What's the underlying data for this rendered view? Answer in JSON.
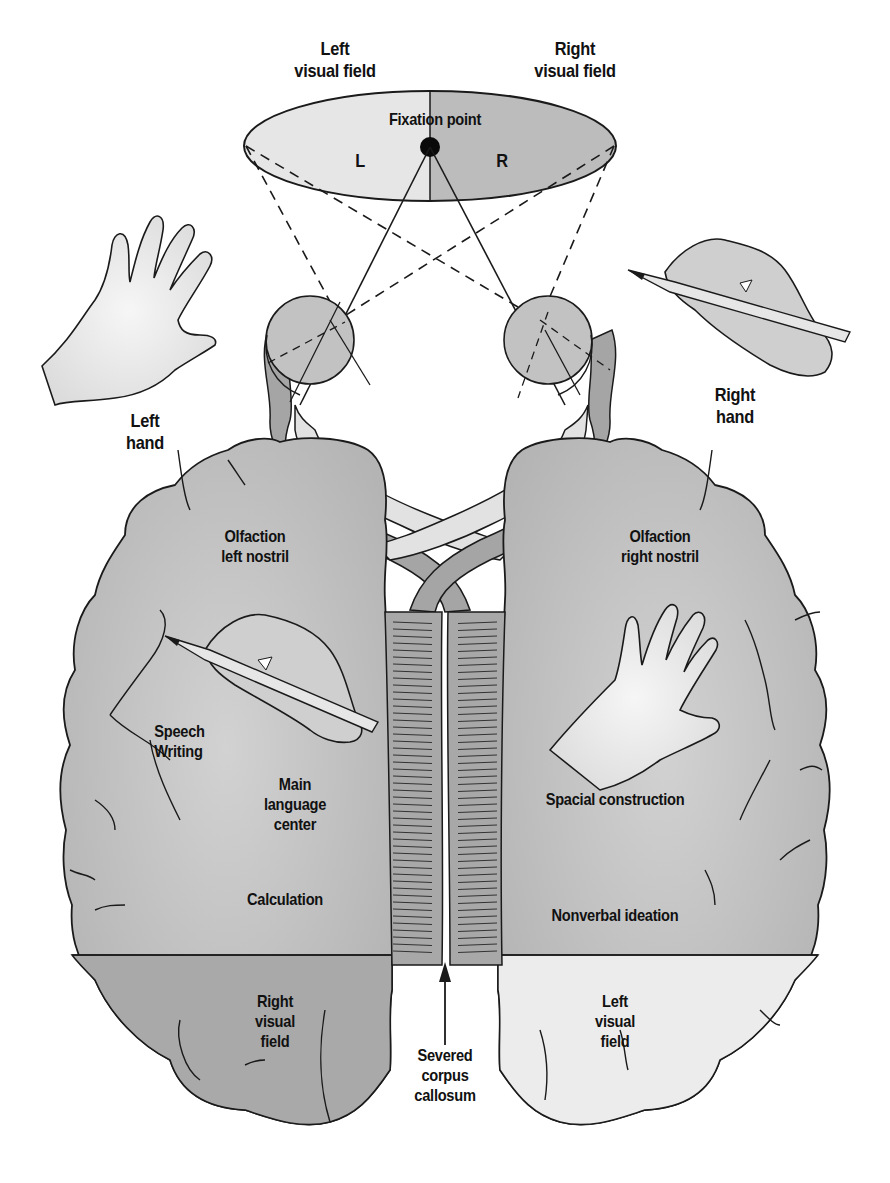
{
  "diagram": {
    "type": "split-brain lateralization diagram",
    "colors": {
      "background": "#ffffff",
      "outline": "#1a1a1a",
      "left_field_fill": "#e6e6e6",
      "right_field_fill": "#bcbcbc",
      "hemisphere_fill": "#c4c4c4",
      "left_occipital_fill": "#a9a9a9",
      "right_occipital_fill": "#ececec",
      "corpus_callosum_fill": "#a8a8a8",
      "optic_tract_dark": "#a5a5a5",
      "optic_tract_light": "#e2e2e2",
      "hand_fill": "#ededed"
    },
    "visual_field": {
      "left_label": [
        "Left",
        "visual field"
      ],
      "right_label": [
        "Right",
        "visual field"
      ],
      "fixation_label": "Fixation point",
      "left_letter": "L",
      "right_letter": "R"
    },
    "hands": {
      "left_label": [
        "Left",
        "hand"
      ],
      "right_label": [
        "Right",
        "hand"
      ]
    },
    "left_hemisphere": {
      "olfaction": [
        "Olfaction",
        "left nostril"
      ],
      "speech_writing": [
        "Speech",
        "Writing"
      ],
      "language": [
        "Main",
        "language",
        "center"
      ],
      "calculation": "Calculation",
      "occipital": [
        "Right",
        "visual",
        "field"
      ]
    },
    "right_hemisphere": {
      "olfaction": [
        "Olfaction",
        "right nostril"
      ],
      "spatial": "Spacial construction",
      "nonverbal": "Nonverbal ideation",
      "occipital": [
        "Left",
        "visual",
        "field"
      ]
    },
    "corpus_callosum_label": [
      "Severed",
      "corpus",
      "callosum"
    ]
  }
}
